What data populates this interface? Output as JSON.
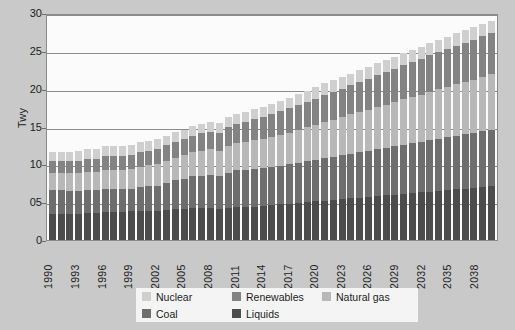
{
  "chart_data": {
    "type": "bar",
    "stacked": true,
    "title": "",
    "xlabel": "",
    "ylabel": "Twy",
    "ylim": [
      0,
      30
    ],
    "yticks": [
      0,
      5,
      10,
      15,
      20,
      25,
      30
    ],
    "ytick_labels": [
      "0",
      "05",
      "10",
      "15",
      "20",
      "25",
      "30"
    ],
    "grid": true,
    "legend_position": "bottom",
    "categories": [
      "1990",
      "1991",
      "1992",
      "1993",
      "1994",
      "1995",
      "1996",
      "1997",
      "1998",
      "1999",
      "2000",
      "2001",
      "2002",
      "2003",
      "2004",
      "2005",
      "2006",
      "2007",
      "2008",
      "2009",
      "2010",
      "2011",
      "2012",
      "2013",
      "2014",
      "2015",
      "2016",
      "2017",
      "2018",
      "2019",
      "2020",
      "2021",
      "2022",
      "2023",
      "2024",
      "2025",
      "2026",
      "2027",
      "2028",
      "2029",
      "2030",
      "2031",
      "2032",
      "2033",
      "2034",
      "2035",
      "2036",
      "2037",
      "2038",
      "2039",
      "2040"
    ],
    "xtick_labels": [
      "1990",
      "1993",
      "1996",
      "1999",
      "2002",
      "2005",
      "2008",
      "2011",
      "2014",
      "2017",
      "2020",
      "2023",
      "2026",
      "2029",
      "2032",
      "2035",
      "2038"
    ],
    "series": [
      {
        "name": "Liquids",
        "color": "#4c4c4c",
        "values": [
          3.5,
          3.5,
          3.5,
          3.5,
          3.6,
          3.6,
          3.7,
          3.7,
          3.7,
          3.8,
          3.9,
          3.9,
          3.9,
          4.0,
          4.1,
          4.1,
          4.2,
          4.2,
          4.2,
          4.1,
          4.2,
          4.3,
          4.3,
          4.4,
          4.5,
          4.6,
          4.7,
          4.8,
          4.9,
          5.0,
          5.1,
          5.2,
          5.3,
          5.4,
          5.5,
          5.6,
          5.7,
          5.8,
          5.9,
          6.0,
          6.1,
          6.2,
          6.3,
          6.4,
          6.5,
          6.6,
          6.7,
          6.8,
          6.9,
          7.0,
          7.1
        ]
      },
      {
        "name": "Coal",
        "color": "#6e6e6e",
        "values": [
          3.1,
          3.1,
          3.0,
          3.0,
          3.0,
          3.0,
          3.1,
          3.1,
          3.0,
          3.0,
          3.1,
          3.2,
          3.3,
          3.6,
          3.8,
          4.0,
          4.2,
          4.3,
          4.4,
          4.4,
          4.7,
          4.9,
          4.9,
          5.0,
          5.0,
          5.0,
          5.1,
          5.2,
          5.3,
          5.4,
          5.5,
          5.6,
          5.7,
          5.8,
          5.9,
          6.0,
          6.1,
          6.2,
          6.3,
          6.4,
          6.5,
          6.6,
          6.7,
          6.8,
          6.9,
          7.0,
          7.1,
          7.2,
          7.3,
          7.4,
          7.5
        ]
      },
      {
        "name": "Natural gas",
        "color": "#b8b8b8",
        "values": [
          2.2,
          2.2,
          2.3,
          2.3,
          2.4,
          2.4,
          2.5,
          2.5,
          2.6,
          2.6,
          2.7,
          2.8,
          2.8,
          2.9,
          3.0,
          3.1,
          3.2,
          3.3,
          3.4,
          3.3,
          3.5,
          3.6,
          3.7,
          3.8,
          3.9,
          4.0,
          4.1,
          4.2,
          4.4,
          4.5,
          4.6,
          4.8,
          4.9,
          5.0,
          5.2,
          5.3,
          5.4,
          5.6,
          5.7,
          5.8,
          6.0,
          6.1,
          6.2,
          6.4,
          6.5,
          6.6,
          6.8,
          6.9,
          7.0,
          7.2,
          7.3
        ]
      },
      {
        "name": "Renewables",
        "color": "#838383",
        "values": [
          1.6,
          1.6,
          1.6,
          1.7,
          1.7,
          1.7,
          1.8,
          1.8,
          1.8,
          1.9,
          1.9,
          1.9,
          2.0,
          2.0,
          2.1,
          2.1,
          2.2,
          2.3,
          2.3,
          2.4,
          2.5,
          2.6,
          2.7,
          2.8,
          2.9,
          3.0,
          3.1,
          3.2,
          3.3,
          3.4,
          3.5,
          3.6,
          3.7,
          3.8,
          3.9,
          4.0,
          4.1,
          4.2,
          4.3,
          4.4,
          4.5,
          4.6,
          4.7,
          4.8,
          4.9,
          5.0,
          5.1,
          5.2,
          5.3,
          5.4,
          5.5
        ]
      },
      {
        "name": "Nuclear",
        "color": "#cfcfcf",
        "values": [
          1.3,
          1.3,
          1.3,
          1.3,
          1.3,
          1.3,
          1.3,
          1.3,
          1.3,
          1.3,
          1.3,
          1.3,
          1.3,
          1.3,
          1.3,
          1.3,
          1.3,
          1.3,
          1.3,
          1.3,
          1.3,
          1.3,
          1.3,
          1.3,
          1.3,
          1.4,
          1.4,
          1.4,
          1.4,
          1.4,
          1.5,
          1.5,
          1.5,
          1.5,
          1.5,
          1.6,
          1.6,
          1.6,
          1.6,
          1.6,
          1.6,
          1.6,
          1.6,
          1.6,
          1.6,
          1.6,
          1.6,
          1.6,
          1.6,
          1.6,
          1.6
        ]
      }
    ],
    "stack_order_bottom_to_top": [
      "Liquids",
      "Coal",
      "Natural gas",
      "Renewables",
      "Nuclear"
    ],
    "legend": [
      {
        "label": "Nuclear",
        "color": "#cfcfcf"
      },
      {
        "label": "Renewables",
        "color": "#838383"
      },
      {
        "label": "Natural gas",
        "color": "#b8b8b8"
      },
      {
        "label": "Coal",
        "color": "#6e6e6e"
      },
      {
        "label": "Liquids",
        "color": "#4c4c4c"
      }
    ]
  },
  "colors": {
    "figure_background": "#c9c9c9",
    "plot_background": "#fbfbfb",
    "axis": "#8a8a8a",
    "gridline": "#8c8c8c",
    "text": "#1d1d1d",
    "legend_background": "#f4f4f4"
  }
}
